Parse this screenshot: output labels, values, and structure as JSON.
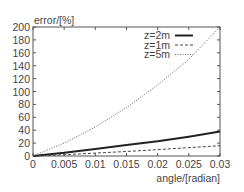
{
  "chart_data": {
    "type": "line",
    "title": "",
    "xlabel": "angle/[radian]",
    "ylabel": "error/[%]",
    "xlim": [
      0,
      0.03
    ],
    "ylim": [
      0,
      200
    ],
    "xticks": [
      "0",
      "0.005",
      "0.01",
      "0.015",
      "0.02",
      "0.025",
      "0.03"
    ],
    "yticks": [
      "0",
      "20",
      "40",
      "60",
      "80",
      "100",
      "120",
      "140",
      "160",
      "180",
      "200"
    ],
    "grid": false,
    "legend_position": "top-right inside",
    "x": [
      0,
      0.005,
      0.01,
      0.015,
      0.02,
      0.025,
      0.03
    ],
    "series": [
      {
        "name": "z=2m",
        "style": "solid-thick",
        "values": [
          0,
          5,
          11,
          17,
          23,
          30,
          38
        ]
      },
      {
        "name": "z=1m",
        "style": "dashed",
        "values": [
          0,
          2,
          4.5,
          7,
          10,
          13,
          16
        ]
      },
      {
        "name": "z=5m",
        "style": "dotted",
        "values": [
          0,
          20,
          45,
          75,
          110,
          150,
          200
        ]
      }
    ]
  }
}
